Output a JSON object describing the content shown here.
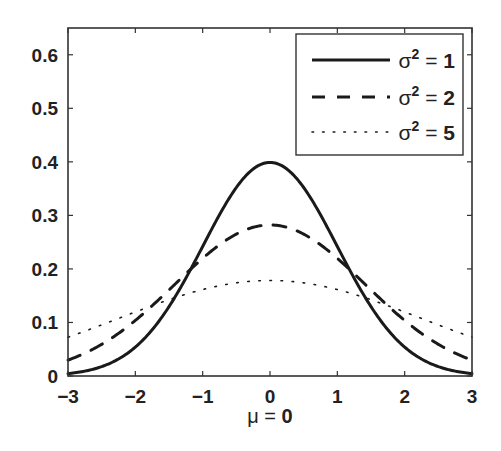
{
  "chart_data": {
    "type": "line",
    "title": "",
    "xlabel": "μ = 0",
    "ylabel": "",
    "xlim": [
      -3,
      3
    ],
    "ylim": [
      0,
      0.65
    ],
    "grid": false,
    "legend_position": "upper right",
    "xticks": [
      -3,
      -2,
      -1,
      0,
      1,
      2,
      3
    ],
    "xtick_labels": [
      "−3",
      "−2",
      "−1",
      "0",
      "1",
      "2",
      "3"
    ],
    "yticks": [
      0,
      0.1,
      0.2,
      0.3,
      0.4,
      0.5,
      0.6
    ],
    "ytick_labels": [
      "0",
      "0.1",
      "0.2",
      "0.3",
      "0.4",
      "0.5",
      "0.6"
    ],
    "x": [
      -3,
      -2.5,
      -2,
      -1.5,
      -1,
      -0.5,
      0,
      0.5,
      1,
      1.5,
      2,
      2.5,
      3
    ],
    "series": [
      {
        "name": "σ² = 1",
        "variance": 1,
        "style": "solid",
        "values": [
          0.0044,
          0.0175,
          0.054,
          0.1295,
          0.242,
          0.3521,
          0.3989,
          0.3521,
          0.242,
          0.1295,
          0.054,
          0.0175,
          0.0044
        ]
      },
      {
        "name": "σ² = 2",
        "variance": 2,
        "style": "dashed",
        "values": [
          0.0297,
          0.0593,
          0.1038,
          0.1594,
          0.2197,
          0.2661,
          0.2821,
          0.2661,
          0.2197,
          0.1594,
          0.1038,
          0.0593,
          0.0297
        ]
      },
      {
        "name": "σ² = 5",
        "variance": 5,
        "style": "dotted",
        "values": [
          0.0733,
          0.0959,
          0.1196,
          0.142,
          0.1614,
          0.1749,
          0.1784,
          0.1749,
          0.1614,
          0.142,
          0.1196,
          0.0959,
          0.0733
        ]
      }
    ]
  },
  "legend": {
    "items": [
      {
        "sym": "σ",
        "exp": "2",
        "eq": " = ",
        "num": "1"
      },
      {
        "sym": "σ",
        "exp": "2",
        "eq": " = ",
        "num": "2"
      },
      {
        "sym": "σ",
        "exp": "2",
        "eq": " = ",
        "num": "5"
      }
    ]
  },
  "xlabel": {
    "sym": "μ",
    "eq": " = ",
    "num": "0"
  },
  "colors": {
    "line": "#1a1a1a",
    "axis": "#333333",
    "background": "#ffffff"
  }
}
